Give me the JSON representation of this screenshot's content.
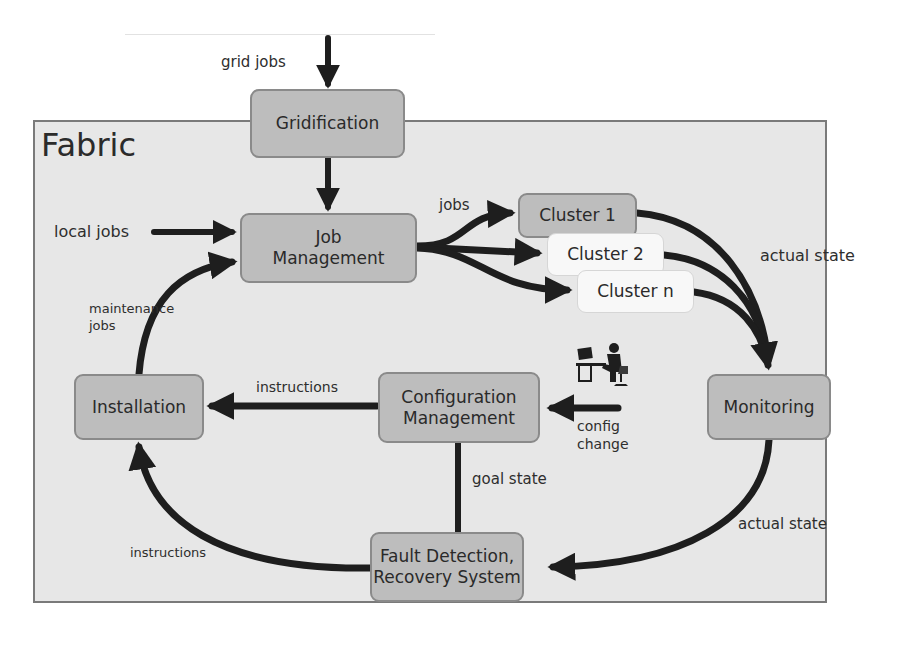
{
  "diagram": {
    "container": {
      "title": "Fabric"
    },
    "nodes": {
      "gridification": "Gridification",
      "job_management": "Job\nManagement",
      "cluster_1": "Cluster 1",
      "cluster_2": "Cluster 2",
      "cluster_n": "Cluster n",
      "monitoring": "Monitoring",
      "configuration_management": "Configuration\nManagement",
      "installation": "Installation",
      "fault_detection": "Fault Detection,\nRecovery System"
    },
    "edge_labels": {
      "grid_jobs": "grid jobs",
      "local_jobs": "local jobs",
      "jobs": "jobs",
      "actual_state_top": "actual state",
      "maintenance_jobs": "maintenance\njobs",
      "instructions_top": "instructions",
      "config_change": "config\nchange",
      "goal_state": "goal state",
      "actual_state_bottom": "actual state",
      "instructions_bottom": "instructions"
    },
    "icons": {
      "operator": "person-at-computer-icon"
    },
    "colors": {
      "fabric_bg": "#e7e7e7",
      "node_fill": "#bdbdbd",
      "node_light_fill": "#f8f8f8",
      "arrow": "#1e1e1e"
    }
  }
}
